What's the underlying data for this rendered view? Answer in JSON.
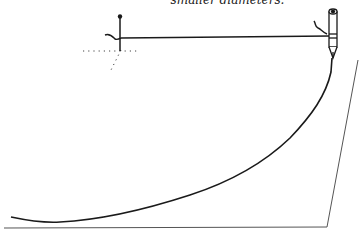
{
  "caption": {
    "text": "smaller diameters."
  },
  "figure": {
    "elements": [
      "pin",
      "string",
      "pen",
      "traced-curve",
      "paper-outline",
      "dotted-guides"
    ]
  },
  "colors": {
    "ink": "#1a1a1a",
    "paper_line": "#555555",
    "background": "#ffffff"
  }
}
